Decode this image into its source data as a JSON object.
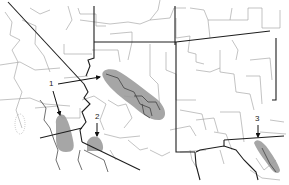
{
  "map": {
    "type": "county outline map",
    "region": "Southwestern United States",
    "colors": {
      "background": "#ffffff",
      "county_lines": "#9a9a9a",
      "state_lines": "#1e1e1e",
      "shading": "#9e9e9e",
      "arrows": "#111111"
    },
    "areas": [
      {
        "id": 1,
        "label": "1",
        "note": "two shaded areas pointed to by label 1 (lower Colorado River valley area and Utah/Arizona plateau band)"
      },
      {
        "id": 2,
        "label": "2",
        "note": "shaded area near southern border west of Arizona"
      },
      {
        "id": 3,
        "label": "3",
        "note": "shaded band in south Texas"
      }
    ]
  }
}
